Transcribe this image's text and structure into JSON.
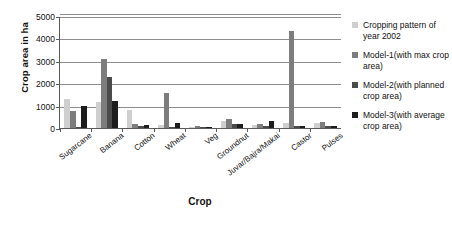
{
  "chart_data": {
    "type": "bar",
    "title": "",
    "xlabel": "Crop",
    "ylabel": "Crop area in ha",
    "ylim": [
      0,
      5000
    ],
    "yticks": [
      0,
      1000,
      2000,
      3000,
      4000,
      5000
    ],
    "grid": true,
    "legend_position": "right",
    "categories": [
      "Sugarcane",
      "Banana",
      "Cotton",
      "Wheat",
      "Veg",
      "Groundnut",
      "Juvar/Bajra/Makai",
      "Castor",
      "Pulses"
    ],
    "series": [
      {
        "name": "Cropping pattern of year 2002",
        "color": "#cfcfcf",
        "values": [
          1300,
          1150,
          800,
          130,
          60,
          330,
          120,
          240,
          210
        ]
      },
      {
        "name": "Model-1(with max crop area)",
        "color": "#7d7d7d",
        "values": [
          750,
          3100,
          180,
          1550,
          70,
          400,
          190,
          4350,
          250
        ]
      },
      {
        "name": "Model-2(with planned crop area)",
        "color": "#4b4b4b",
        "values": [
          60,
          2270,
          70,
          60,
          50,
          180,
          110,
          110,
          100
        ]
      },
      {
        "name": "Model-3(with average crop area)",
        "color": "#1d1d1d",
        "values": [
          1000,
          1200,
          120,
          230,
          45,
          200,
          320,
          100,
          90
        ]
      }
    ]
  },
  "legend": {
    "items": [
      {
        "label": "Cropping pattern of year 2002",
        "color": "#cfcfcf"
      },
      {
        "label": "Model-1(with max crop area)",
        "color": "#7d7d7d"
      },
      {
        "label": "Model-2(with planned crop area)",
        "color": "#4b4b4b"
      },
      {
        "label": "Model-3(with average crop area)",
        "color": "#1d1d1d"
      }
    ]
  }
}
